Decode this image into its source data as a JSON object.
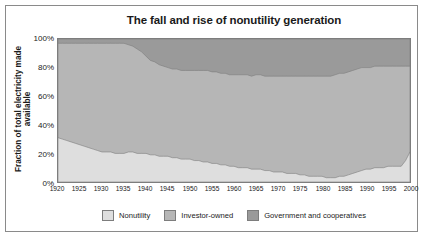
{
  "figure": {
    "title": "The fall and rise of nonutility generation",
    "ylabel": "Fraction of total electricity made available"
  },
  "colors": {
    "nonutility": "#dedede",
    "investor_owned": "#b6b6b6",
    "government": "#9a9a9a",
    "outline": "#7d7d7d",
    "frame": "#8a8a8a",
    "text": "#1a1a1a",
    "background": "#ffffff"
  },
  "legend": {
    "items": [
      {
        "label": "Nonutility",
        "color_key": "nonutility"
      },
      {
        "label": "Investor-owned",
        "color_key": "investor_owned"
      },
      {
        "label": "Government and cooperatives",
        "color_key": "government"
      }
    ]
  },
  "yticks": [
    "0%",
    "20%",
    "40%",
    "60%",
    "80%",
    "100%"
  ],
  "xticks": [
    "1920",
    "1925",
    "1930",
    "1935",
    "1940",
    "1945",
    "1950",
    "1955",
    "1960",
    "1965",
    "1970",
    "1975",
    "1980",
    "1985",
    "1990",
    "1995",
    "2000"
  ],
  "chart_data": {
    "type": "area",
    "title": "The fall and rise of nonutility generation",
    "subtitle": "",
    "xlabel": "",
    "ylabel": "Fraction of total electricity made available",
    "xlim": [
      1920,
      2000
    ],
    "ylim": [
      0,
      100
    ],
    "grid": false,
    "legend_position": "bottom",
    "stacked": true,
    "y_tick_values": [
      0,
      20,
      40,
      60,
      80,
      100
    ],
    "y_tick_labels": [
      "0%",
      "20%",
      "40%",
      "60%",
      "80%",
      "100%"
    ],
    "x_tick_values": [
      1920,
      1925,
      1930,
      1935,
      1940,
      1945,
      1950,
      1955,
      1960,
      1965,
      1970,
      1975,
      1980,
      1985,
      1990,
      1995,
      2000
    ],
    "x": [
      1920,
      1921,
      1922,
      1923,
      1924,
      1925,
      1926,
      1927,
      1928,
      1929,
      1930,
      1931,
      1932,
      1933,
      1934,
      1935,
      1936,
      1937,
      1938,
      1939,
      1940,
      1941,
      1942,
      1943,
      1944,
      1945,
      1946,
      1947,
      1948,
      1949,
      1950,
      1951,
      1952,
      1953,
      1954,
      1955,
      1956,
      1957,
      1958,
      1959,
      1960,
      1961,
      1962,
      1963,
      1964,
      1965,
      1966,
      1967,
      1968,
      1969,
      1970,
      1971,
      1972,
      1973,
      1974,
      1975,
      1976,
      1977,
      1978,
      1979,
      1980,
      1981,
      1982,
      1983,
      1984,
      1985,
      1986,
      1987,
      1988,
      1989,
      1990,
      1991,
      1992,
      1993,
      1994,
      1995,
      1996,
      1997,
      1998,
      1999,
      2000
    ],
    "series": [
      {
        "name": "Nonutility",
        "color": "#dedede",
        "values": [
          31,
          30,
          29,
          28,
          27,
          26,
          25,
          24,
          23,
          22,
          21,
          21,
          21,
          20,
          20,
          20,
          21,
          21,
          20,
          20,
          20,
          19,
          19,
          18,
          18,
          18,
          17,
          17,
          16,
          16,
          16,
          15,
          15,
          14,
          14,
          13,
          13,
          12,
          12,
          11,
          11,
          10,
          10,
          10,
          9,
          9,
          9,
          8,
          8,
          7,
          7,
          7,
          6,
          6,
          6,
          5,
          5,
          4,
          4,
          4,
          4,
          3,
          3,
          3,
          4,
          4,
          5,
          6,
          7,
          8,
          9,
          9,
          10,
          10,
          10,
          11,
          11,
          11,
          11,
          15,
          21
        ]
      },
      {
        "name": "Investor-owned",
        "color": "#b6b6b6",
        "values": [
          66,
          67,
          68,
          69,
          70,
          71,
          72,
          73,
          74,
          75,
          76,
          76,
          76,
          77,
          77,
          77,
          75,
          74,
          73,
          71,
          68,
          66,
          65,
          64,
          63,
          62,
          62,
          62,
          62,
          62,
          62,
          63,
          63,
          64,
          64,
          64,
          64,
          64,
          64,
          64,
          64,
          65,
          65,
          65,
          65,
          66,
          66,
          66,
          66,
          67,
          67,
          67,
          68,
          68,
          68,
          69,
          69,
          70,
          70,
          70,
          70,
          71,
          71,
          72,
          72,
          72,
          72,
          72,
          72,
          72,
          71,
          71,
          71,
          71,
          71,
          70,
          70,
          70,
          70,
          66,
          60
        ]
      },
      {
        "name": "Government and cooperatives",
        "color": "#9a9a9a",
        "values": [
          3,
          3,
          3,
          3,
          3,
          3,
          3,
          3,
          3,
          3,
          3,
          3,
          3,
          3,
          3,
          3,
          4,
          5,
          7,
          9,
          12,
          15,
          16,
          18,
          19,
          20,
          21,
          21,
          22,
          22,
          22,
          22,
          22,
          22,
          22,
          23,
          23,
          24,
          24,
          25,
          25,
          25,
          25,
          25,
          26,
          25,
          25,
          26,
          26,
          26,
          26,
          26,
          26,
          26,
          26,
          26,
          26,
          26,
          26,
          26,
          26,
          26,
          26,
          25,
          24,
          24,
          23,
          22,
          21,
          20,
          20,
          20,
          19,
          19,
          19,
          19,
          19,
          19,
          19,
          19,
          19
        ]
      }
    ]
  }
}
